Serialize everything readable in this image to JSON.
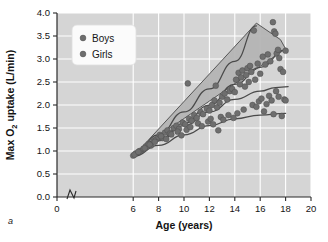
{
  "figure": {
    "panel_label": "a",
    "background_color": "#d5d5d5",
    "gridline_color": "#ffffff",
    "marker_color": "#6e6e6e",
    "band_color": "#b4b4b4",
    "curve_color": "#4a4a4a"
  },
  "legend": {
    "position": "top-left-inside",
    "entries": [
      {
        "label": "Boys",
        "marker": "filled-circle",
        "color": "#6e6e6e"
      },
      {
        "label": "Girls",
        "marker": "filled-circle",
        "color": "#6e6e6e"
      }
    ]
  },
  "chart_data": {
    "type": "scatter",
    "title": "",
    "xlabel": "Age (years)",
    "ylabel": "Max O2 uptake (L/min)",
    "ylabel_parts": {
      "pre": "Max O",
      "sub": "2",
      "post": " uptake (L/min)"
    },
    "xlim": [
      0,
      20
    ],
    "ylim": [
      0.0,
      4.0
    ],
    "xticks": [
      0,
      6,
      8,
      10,
      12,
      14,
      16,
      18,
      20
    ],
    "yticks": [
      0.0,
      0.5,
      1.0,
      1.5,
      2.0,
      2.5,
      3.0,
      3.5,
      4.0
    ],
    "ytick_labels": [
      "0.0",
      "0.5",
      "1.0",
      "1.5",
      "2.0",
      "2.5",
      "3.0",
      "3.5",
      "4.0"
    ],
    "xtick_labels": [
      "0",
      "6",
      "8",
      "10",
      "12",
      "14",
      "16",
      "18",
      "20"
    ],
    "axis_break": {
      "axis": "x",
      "between": [
        0,
        6
      ],
      "symbol": "zigzag"
    },
    "grid": true,
    "legend_position": "upper left",
    "series": [
      {
        "name": "Boys",
        "points": [
          [
            6.0,
            0.9
          ],
          [
            6.2,
            0.95
          ],
          [
            6.5,
            1.0
          ],
          [
            6.8,
            1.05
          ],
          [
            7.0,
            1.1
          ],
          [
            7.2,
            1.15
          ],
          [
            7.4,
            1.12
          ],
          [
            7.6,
            1.22
          ],
          [
            7.8,
            1.25
          ],
          [
            8.0,
            1.3
          ],
          [
            8.1,
            1.35
          ],
          [
            8.3,
            1.28
          ],
          [
            8.5,
            1.4
          ],
          [
            8.7,
            1.45
          ],
          [
            8.9,
            1.38
          ],
          [
            9.2,
            1.5
          ],
          [
            9.4,
            1.55
          ],
          [
            9.6,
            1.48
          ],
          [
            9.9,
            1.62
          ],
          [
            10.1,
            1.58
          ],
          [
            10.3,
            2.47
          ],
          [
            10.4,
            1.7
          ],
          [
            10.6,
            1.66
          ],
          [
            10.8,
            1.78
          ],
          [
            11.0,
            1.72
          ],
          [
            11.3,
            1.85
          ],
          [
            11.5,
            1.8
          ],
          [
            11.8,
            1.92
          ],
          [
            12.0,
            1.88
          ],
          [
            12.2,
            2.0
          ],
          [
            12.4,
            2.1
          ],
          [
            12.5,
            2.42
          ],
          [
            12.6,
            1.95
          ],
          [
            12.8,
            2.05
          ],
          [
            13.0,
            2.18
          ],
          [
            13.2,
            2.25
          ],
          [
            13.4,
            2.12
          ],
          [
            13.6,
            2.3
          ],
          [
            13.8,
            2.35
          ],
          [
            14.0,
            2.28
          ],
          [
            14.1,
            2.55
          ],
          [
            14.3,
            2.7
          ],
          [
            14.4,
            2.45
          ],
          [
            14.5,
            2.6
          ],
          [
            14.6,
            2.75
          ],
          [
            14.8,
            2.4
          ],
          [
            14.9,
            2.65
          ],
          [
            15.0,
            2.8
          ],
          [
            15.1,
            2.5
          ],
          [
            15.2,
            2.85
          ],
          [
            15.3,
            2.72
          ],
          [
            15.5,
            3.62
          ],
          [
            15.6,
            2.55
          ],
          [
            15.8,
            2.9
          ],
          [
            16.0,
            2.68
          ],
          [
            16.2,
            3.05
          ],
          [
            16.4,
            2.88
          ],
          [
            16.6,
            3.1
          ],
          [
            16.8,
            2.95
          ],
          [
            17.0,
            3.8
          ],
          [
            17.1,
            3.6
          ],
          [
            17.2,
            3.55
          ],
          [
            17.3,
            3.12
          ],
          [
            17.4,
            3.2
          ],
          [
            17.5,
            3.02
          ],
          [
            17.6,
            2.78
          ],
          [
            17.8,
            2.72
          ],
          [
            18.0,
            3.18
          ]
        ]
      },
      {
        "name": "Girls",
        "points": [
          [
            6.1,
            0.92
          ],
          [
            6.4,
            0.98
          ],
          [
            6.9,
            1.06
          ],
          [
            7.3,
            1.14
          ],
          [
            7.7,
            1.2
          ],
          [
            8.2,
            1.32
          ],
          [
            8.6,
            1.26
          ],
          [
            9.0,
            1.36
          ],
          [
            9.5,
            1.42
          ],
          [
            9.8,
            1.34
          ],
          [
            10.2,
            1.46
          ],
          [
            10.5,
            1.52
          ],
          [
            11.1,
            1.6
          ],
          [
            11.4,
            1.54
          ],
          [
            11.9,
            1.64
          ],
          [
            12.1,
            1.7
          ],
          [
            12.3,
            1.58
          ],
          [
            12.7,
            1.45
          ],
          [
            12.9,
            1.74
          ],
          [
            13.1,
            1.68
          ],
          [
            13.5,
            1.78
          ],
          [
            13.9,
            1.72
          ],
          [
            14.2,
            1.82
          ],
          [
            14.7,
            1.9
          ],
          [
            15.4,
            2.0
          ],
          [
            15.7,
            1.96
          ],
          [
            15.9,
            2.08
          ],
          [
            16.1,
            2.14
          ],
          [
            16.3,
            1.86
          ],
          [
            16.5,
            2.02
          ],
          [
            16.7,
            2.2
          ],
          [
            16.9,
            2.1
          ],
          [
            17.05,
            1.8
          ],
          [
            17.25,
            2.3
          ],
          [
            17.45,
            2.18
          ],
          [
            17.7,
            1.76
          ],
          [
            17.9,
            2.12
          ],
          [
            18.0,
            2.1
          ]
        ]
      }
    ],
    "bands": [
      {
        "name": "Boys range band",
        "vertices": [
          [
            6.0,
            0.88
          ],
          [
            15.7,
            3.78
          ],
          [
            17.6,
            3.42
          ],
          [
            18.0,
            3.22
          ],
          [
            6.0,
            0.95
          ]
        ]
      }
    ],
    "curves": [
      {
        "name": "Boys upper trend",
        "points": [
          [
            6.0,
            0.9
          ],
          [
            8,
            1.35
          ],
          [
            10,
            1.85
          ],
          [
            12,
            2.35
          ],
          [
            14,
            2.95
          ],
          [
            15.7,
            3.72
          ]
        ]
      },
      {
        "name": "Boys mean trend",
        "points": [
          [
            6.0,
            0.9
          ],
          [
            8,
            1.25
          ],
          [
            10,
            1.6
          ],
          [
            12,
            2.0
          ],
          [
            14,
            2.45
          ],
          [
            16,
            2.82
          ],
          [
            18,
            3.2
          ]
        ]
      },
      {
        "name": "Girls mean trend",
        "points": [
          [
            6.0,
            0.9
          ],
          [
            8,
            1.22
          ],
          [
            10,
            1.55
          ],
          [
            12,
            1.85
          ],
          [
            14,
            2.12
          ],
          [
            16,
            2.3
          ],
          [
            17.2,
            2.38
          ],
          [
            18.2,
            2.4
          ]
        ]
      },
      {
        "name": "Girls lower trend",
        "points": [
          [
            6.0,
            0.88
          ],
          [
            8,
            1.12
          ],
          [
            10,
            1.35
          ],
          [
            12,
            1.55
          ],
          [
            14,
            1.7
          ],
          [
            16,
            1.78
          ],
          [
            18,
            1.82
          ]
        ]
      }
    ]
  }
}
